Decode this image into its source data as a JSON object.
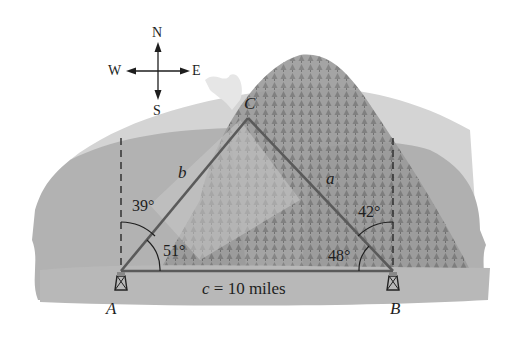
{
  "figure": {
    "compass": {
      "north": "N",
      "south": "S",
      "east": "E",
      "west": "W"
    },
    "vertices": {
      "A": "A",
      "B": "B",
      "C": "C"
    },
    "sides": {
      "a": "a",
      "b": "b",
      "c_label": "c = 10 miles"
    },
    "angles": {
      "A_from_north": "39°",
      "A_interior": "51°",
      "B_from_north": "42°",
      "B_interior": "48°"
    },
    "colors": {
      "triangle_line": "#5a5a5a",
      "dashed_north_line": "#2a2a2a",
      "text": "#1e1e1e",
      "background_dark": "#a9a9a9",
      "background_light": "#c9c9c9",
      "mountain": "#8c8c8c"
    }
  }
}
